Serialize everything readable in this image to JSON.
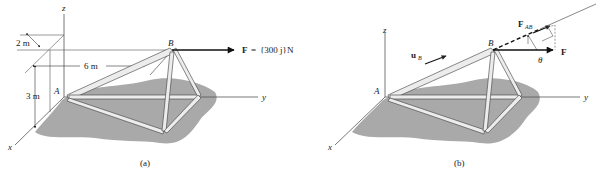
{
  "figure_a": {
    "caption": "(a)",
    "axes": {
      "x": "x",
      "y": "y",
      "z": "z"
    },
    "points": {
      "A": "A",
      "B": "B"
    },
    "dimensions": {
      "dim_2m": "2 m",
      "dim_6m": "6 m",
      "dim_3m": "3 m"
    },
    "force": {
      "symbol": "F",
      "equals": "=",
      "value": "{300 j}N"
    }
  },
  "figure_b": {
    "caption": "(b)",
    "axes": {
      "x": "x",
      "y": "y",
      "z": "z"
    },
    "points": {
      "A": "A",
      "B": "B"
    },
    "unit_vector": {
      "symbol": "u",
      "subscript": "B"
    },
    "projection": {
      "symbol": "F",
      "subscript": "AB"
    },
    "force": {
      "symbol": "F"
    },
    "angle": "θ"
  },
  "colors": {
    "ground": "#a9a9a9",
    "member_fill": "#ececec",
    "member_stroke": "#3a3a3a",
    "line": "#555555",
    "arrow": "#111111"
  }
}
